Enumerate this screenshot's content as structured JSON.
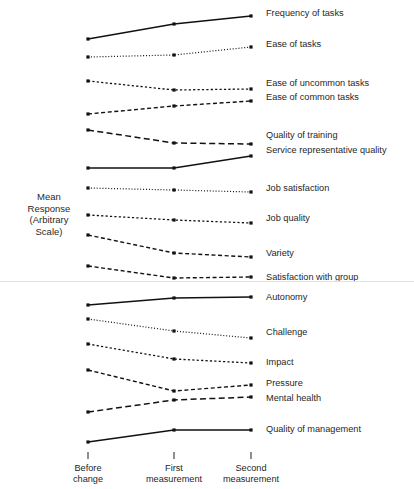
{
  "axis": {
    "y_label_lines": [
      "Mean",
      "Response",
      "(Arbitrary",
      "Scale)"
    ],
    "x_tick_labels": [
      {
        "line1": "Before",
        "line2": "change"
      },
      {
        "line1": "First",
        "line2": "measurement"
      },
      {
        "line1": "Second",
        "line2": "measurement"
      }
    ]
  },
  "chart_data": {
    "type": "line",
    "title": "",
    "xlabel": "",
    "ylabel": "Mean Response (Arbitrary Scale)",
    "categories": [
      "Before change",
      "First measurement",
      "Second measurement"
    ],
    "x_positions": [
      88,
      174,
      251
    ],
    "grid": false,
    "legend": "right-of-lines (direct labeling)",
    "axis_note": "Arbitrary vertical scale, no numeric tick labels; values below are pixel y-coordinates of plotted points (smaller = higher response).",
    "ylim_pixels": [
      489,
      0
    ],
    "series": [
      {
        "name": "Frequency of tasks",
        "style": "solid",
        "values": [
          39,
          24,
          16
        ],
        "label_y": 13
      },
      {
        "name": "Ease of tasks",
        "style": "dotted",
        "values": [
          57,
          55,
          47
        ],
        "label_y": 44
      },
      {
        "name": "Ease of uncommon tasks",
        "style": "dashed-fine",
        "values": [
          81,
          90,
          89
        ],
        "label_y": 83
      },
      {
        "name": "Ease of common tasks",
        "style": "dashed",
        "values": [
          114,
          106,
          101
        ],
        "label_y": 97
      },
      {
        "name": "Quality of training",
        "style": "long-dash",
        "values": [
          130,
          143,
          144
        ],
        "label_y": 135
      },
      {
        "name": "Service representative quality",
        "style": "solid",
        "values": [
          168,
          168,
          156
        ],
        "label_y": 150
      },
      {
        "name": "Job satisfaction",
        "style": "dotted",
        "values": [
          188,
          190,
          192
        ],
        "label_y": 188
      },
      {
        "name": "Job quality",
        "style": "dashed-fine",
        "values": [
          215,
          220,
          223
        ],
        "label_y": 218
      },
      {
        "name": "Variety",
        "style": "dashed",
        "values": [
          235,
          253,
          257
        ],
        "label_y": 253
      },
      {
        "name": "Satisfaction with group",
        "style": "dashed",
        "values": [
          266,
          278,
          277
        ],
        "label_y": 277
      },
      {
        "name": "Autonomy",
        "style": "solid",
        "values": [
          305,
          298,
          297
        ],
        "label_y": 297
      },
      {
        "name": "Challenge",
        "style": "dotted",
        "values": [
          319,
          331,
          338
        ],
        "label_y": 332
      },
      {
        "name": "Impact",
        "style": "dashed-fine",
        "values": [
          344,
          359,
          363
        ],
        "label_y": 362
      },
      {
        "name": "Pressure",
        "style": "dashed",
        "values": [
          370,
          391,
          385
        ],
        "label_y": 383
      },
      {
        "name": "Mental health",
        "style": "long-dash",
        "values": [
          412,
          400,
          397
        ],
        "label_y": 398
      },
      {
        "name": "Quality of management",
        "style": "solid",
        "values": [
          442,
          430,
          430
        ],
        "label_y": 429
      }
    ]
  }
}
